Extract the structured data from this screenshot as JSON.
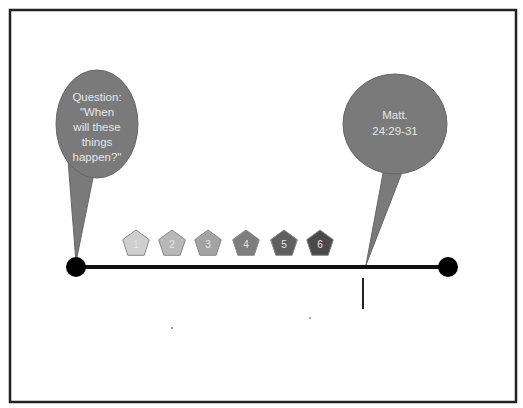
{
  "diagram": {
    "type": "timeline",
    "colors": {
      "frame": "#222222",
      "line": "#111111",
      "bubble": "#7a7a7a",
      "bubble_text": "#e8e8e8"
    },
    "callouts": [
      {
        "id": "question",
        "lines": [
          "Question:",
          "\"When",
          "will these",
          "things",
          "happen?\""
        ]
      },
      {
        "id": "matthew",
        "lines": [
          "Matt.",
          "24:29-31"
        ]
      }
    ],
    "markers": [
      {
        "label": "1",
        "color": "#cfcfcf"
      },
      {
        "label": "2",
        "color": "#b8b8b8"
      },
      {
        "label": "3",
        "color": "#a3a3a3"
      },
      {
        "label": "4",
        "color": "#7e7e7e"
      },
      {
        "label": "5",
        "color": "#5f5f5f"
      },
      {
        "label": "6",
        "color": "#4a4a4a"
      }
    ]
  }
}
